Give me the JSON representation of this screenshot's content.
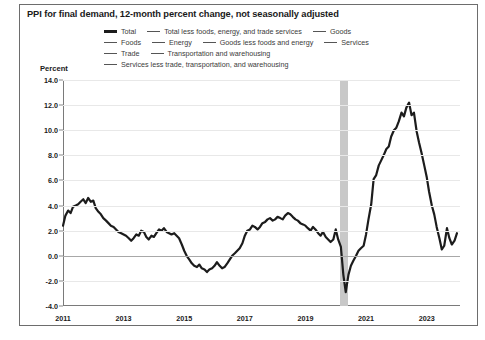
{
  "title": "PPI for final demand, 12-month percent change, not seasonally adjusted",
  "axis": {
    "ylabel": "Percent"
  },
  "legend": {
    "rows": [
      [
        {
          "label": "Total",
          "style": "thick"
        },
        {
          "label": "Total less foods, energy, and trade services",
          "style": "thin"
        },
        {
          "label": "Goods",
          "style": "thin"
        }
      ],
      [
        {
          "label": "Foods",
          "style": "thin"
        },
        {
          "label": "Energy",
          "style": "thin"
        },
        {
          "label": "Goods less foods and energy",
          "style": "thin"
        },
        {
          "label": "Services",
          "style": "thin"
        }
      ],
      [
        {
          "label": "Trade",
          "style": "thin"
        },
        {
          "label": "Transportation and warehousing",
          "style": "thin"
        }
      ],
      [
        {
          "label": "Services less trade, transportation, and warehousing",
          "style": "thin"
        }
      ]
    ]
  },
  "chart_data": {
    "type": "line",
    "title": "PPI for final demand, 12-month percent change, not seasonally adjusted",
    "xlabel": "",
    "ylabel": "Percent",
    "ylim": [
      -4.0,
      14.0
    ],
    "ytick_labels": [
      "14.0",
      "12.0",
      "10.0",
      "8.0",
      "6.0",
      "4.0",
      "2.0",
      "0.0",
      "-2.0",
      "-4.0"
    ],
    "ytick_values": [
      14.0,
      12.0,
      10.0,
      8.0,
      6.0,
      4.0,
      2.0,
      0.0,
      -2.0,
      -4.0
    ],
    "xtick_labels": [
      "2011",
      "2013",
      "2015",
      "2017",
      "2019",
      "2021",
      "2023"
    ],
    "xtick_values": [
      2011.0,
      2013.0,
      2015.0,
      2017.0,
      2019.0,
      2021.0,
      2023.0
    ],
    "xlim": [
      2011.0,
      2024.1
    ],
    "grid": true,
    "legend_position": "top",
    "annotations": [
      {
        "type": "recession-band",
        "label": "2020 recession shading",
        "x_start": 2020.15,
        "x_end": 2020.4,
        "color": "#c8c8c8"
      }
    ],
    "series": [
      {
        "name": "Total",
        "color": "#1c1c1c",
        "x": [
          2011.0,
          2011.08,
          2011.17,
          2011.25,
          2011.33,
          2011.42,
          2011.5,
          2011.58,
          2011.67,
          2011.75,
          2011.83,
          2011.92,
          2012.0,
          2012.08,
          2012.17,
          2012.25,
          2012.33,
          2012.42,
          2012.5,
          2012.58,
          2012.67,
          2012.75,
          2012.83,
          2012.92,
          2013.0,
          2013.08,
          2013.17,
          2013.25,
          2013.33,
          2013.42,
          2013.5,
          2013.58,
          2013.67,
          2013.75,
          2013.83,
          2013.92,
          2014.0,
          2014.08,
          2014.17,
          2014.25,
          2014.33,
          2014.42,
          2014.5,
          2014.58,
          2014.67,
          2014.75,
          2014.83,
          2014.92,
          2015.0,
          2015.08,
          2015.17,
          2015.25,
          2015.33,
          2015.42,
          2015.5,
          2015.58,
          2015.67,
          2015.75,
          2015.83,
          2015.92,
          2016.0,
          2016.08,
          2016.17,
          2016.25,
          2016.33,
          2016.42,
          2016.5,
          2016.58,
          2016.67,
          2016.75,
          2016.83,
          2016.92,
          2017.0,
          2017.08,
          2017.17,
          2017.25,
          2017.33,
          2017.42,
          2017.5,
          2017.58,
          2017.67,
          2017.75,
          2017.83,
          2017.92,
          2018.0,
          2018.08,
          2018.17,
          2018.25,
          2018.33,
          2018.42,
          2018.5,
          2018.58,
          2018.67,
          2018.75,
          2018.83,
          2018.92,
          2019.0,
          2019.08,
          2019.17,
          2019.25,
          2019.33,
          2019.42,
          2019.5,
          2019.58,
          2019.67,
          2019.75,
          2019.83,
          2019.92,
          2020.0,
          2020.08,
          2020.17,
          2020.25,
          2020.33,
          2020.42,
          2020.5,
          2020.58,
          2020.67,
          2020.75,
          2020.83,
          2020.92,
          2021.0,
          2021.08,
          2021.17,
          2021.25,
          2021.33,
          2021.42,
          2021.5,
          2021.58,
          2021.67,
          2021.75,
          2021.83,
          2021.92,
          2022.0,
          2022.08,
          2022.17,
          2022.25,
          2022.33,
          2022.42,
          2022.5,
          2022.58,
          2022.67,
          2022.75,
          2022.83,
          2022.92,
          2023.0,
          2023.08,
          2023.17,
          2023.25,
          2023.33,
          2023.42,
          2023.5,
          2023.58,
          2023.67,
          2023.75,
          2023.83,
          2023.92,
          2024.0
        ],
        "values": [
          2.4,
          3.2,
          3.6,
          3.4,
          3.9,
          4.0,
          4.1,
          4.3,
          4.5,
          4.2,
          4.6,
          4.3,
          4.4,
          3.8,
          3.5,
          3.3,
          3.0,
          2.8,
          2.6,
          2.4,
          2.3,
          2.1,
          1.9,
          1.8,
          1.7,
          1.6,
          1.4,
          1.2,
          1.4,
          1.7,
          1.6,
          2.0,
          1.9,
          1.5,
          1.3,
          1.6,
          1.5,
          1.8,
          2.1,
          2.0,
          2.2,
          1.9,
          1.8,
          1.7,
          1.8,
          1.6,
          1.4,
          0.9,
          0.4,
          0.0,
          -0.3,
          -0.6,
          -0.8,
          -0.9,
          -0.7,
          -1.0,
          -1.1,
          -1.3,
          -1.1,
          -1.0,
          -0.8,
          -0.5,
          -0.8,
          -1.0,
          -0.9,
          -0.6,
          -0.3,
          0.0,
          0.2,
          0.4,
          0.6,
          1.0,
          1.6,
          2.0,
          2.1,
          2.4,
          2.3,
          2.1,
          2.3,
          2.6,
          2.7,
          2.9,
          3.0,
          2.8,
          2.9,
          3.1,
          3.0,
          2.9,
          3.2,
          3.4,
          3.3,
          3.1,
          2.9,
          2.8,
          2.6,
          2.5,
          2.4,
          2.2,
          2.0,
          2.3,
          2.1,
          1.8,
          1.6,
          1.9,
          1.5,
          1.3,
          1.1,
          1.3,
          2.1,
          1.3,
          0.7,
          -1.5,
          -2.9,
          -1.5,
          -0.8,
          -0.4,
          0.0,
          0.4,
          0.6,
          0.8,
          1.7,
          2.9,
          4.1,
          6.1,
          6.4,
          7.2,
          7.6,
          8.0,
          8.5,
          8.7,
          9.5,
          10.0,
          10.2,
          10.7,
          11.4,
          11.1,
          11.8,
          12.2,
          11.2,
          11.4,
          9.9,
          9.0,
          8.2,
          7.2,
          6.3,
          5.1,
          4.0,
          3.3,
          2.3,
          1.4,
          0.5,
          0.8,
          2.2,
          1.4,
          0.9,
          1.2,
          1.8
        ]
      }
    ]
  }
}
